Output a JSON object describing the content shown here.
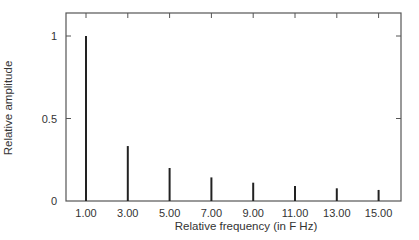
{
  "chart_data": {
    "type": "bar",
    "subtype": "stem",
    "title": "",
    "xlabel": "Relative frequency (in F Hz)",
    "ylabel": "Relative amplitude",
    "categories": [
      "1.00",
      "3.00",
      "5.00",
      "7.00",
      "9.00",
      "11.00",
      "13.00",
      "15.00"
    ],
    "x": [
      1,
      3,
      5,
      7,
      9,
      11,
      13,
      15
    ],
    "values": [
      1.0,
      0.333,
      0.2,
      0.143,
      0.111,
      0.091,
      0.077,
      0.067
    ],
    "y_ticks": [
      0,
      0.5,
      1
    ],
    "y_tick_labels": [
      "0",
      "0.5",
      "1"
    ],
    "x_tick_labels": [
      "1.00",
      "3.00",
      "5.00",
      "7.00",
      "9.00",
      "11.00",
      "13.00",
      "15.00"
    ],
    "ylim": [
      0,
      1.14
    ],
    "xlim": [
      0,
      16
    ],
    "grid": false,
    "legend": null,
    "colors": {
      "bars": "#222222",
      "frame": "#555555",
      "text": "#333333"
    }
  }
}
